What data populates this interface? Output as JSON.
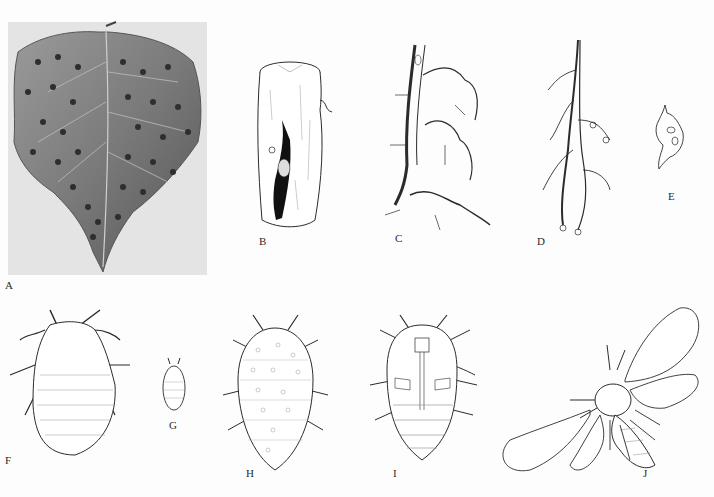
{
  "figure": {
    "type": "scientific-plate",
    "background": "#fdfdfd",
    "panels": [
      {
        "id": "A",
        "label": "A",
        "kind": "photograph",
        "subject": "leaf with galls"
      },
      {
        "id": "B",
        "label": "B",
        "kind": "drawing",
        "subject": "stem section with gall cavity"
      },
      {
        "id": "C",
        "label": "C",
        "kind": "drawing",
        "subject": "root with galls"
      },
      {
        "id": "D",
        "label": "D",
        "kind": "drawing",
        "subject": "root branching with nodules"
      },
      {
        "id": "E",
        "label": "E",
        "kind": "drawing",
        "subject": "single gall"
      },
      {
        "id": "F",
        "label": "F",
        "kind": "drawing",
        "subject": "insect dorsal view, large"
      },
      {
        "id": "G",
        "label": "G",
        "kind": "drawing",
        "subject": "insect small"
      },
      {
        "id": "H",
        "label": "H",
        "kind": "drawing",
        "subject": "insect dorsal view, spotted"
      },
      {
        "id": "I",
        "label": "I",
        "kind": "drawing",
        "subject": "insect ventral view"
      },
      {
        "id": "J",
        "label": "J",
        "kind": "drawing",
        "subject": "winged insect"
      }
    ]
  },
  "colors": {
    "line": "#2b2b2b",
    "photo_bg": "#e4e4e4",
    "leaf_dark": "#5a5a5a",
    "leaf_mid": "#8a8a8a",
    "gall": "#2e2e2e"
  }
}
